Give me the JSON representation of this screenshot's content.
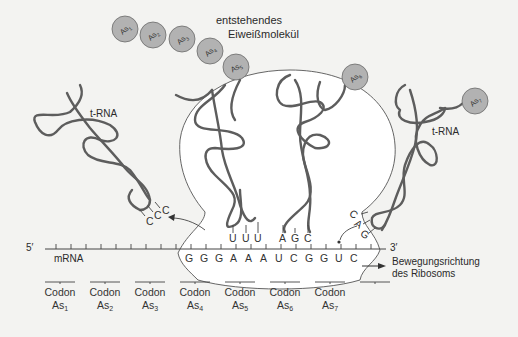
{
  "title_label": {
    "line1": "entstehendes",
    "line2": "Eiweißmolekül"
  },
  "amino_acids": [
    "As1",
    "As2",
    "As3",
    "As4",
    "As5",
    "As6",
    "As7"
  ],
  "amino_acid_display": [
    {
      "base": "As",
      "sub": "1"
    },
    {
      "base": "As",
      "sub": "2"
    },
    {
      "base": "As",
      "sub": "3"
    },
    {
      "base": "As",
      "sub": "4"
    },
    {
      "base": "As",
      "sub": "5"
    },
    {
      "base": "As",
      "sub": "6"
    },
    {
      "base": "As",
      "sub": "7"
    }
  ],
  "trna_labels": {
    "left": "t-RNA",
    "right": "t-RNA"
  },
  "anticodons": {
    "left_leaving": [
      "C",
      "C",
      "C"
    ],
    "site_1": [
      "U",
      "U",
      "U"
    ],
    "site_2": [
      "A",
      "G",
      "C"
    ],
    "right_incoming": [
      "C",
      "A",
      "G"
    ]
  },
  "mrna": {
    "label": "mRNA",
    "five_prime": "5′",
    "three_prime": "3′",
    "bases": [
      "G",
      "G",
      "G",
      "A",
      "A",
      "A",
      "U",
      "C",
      "G",
      "G",
      "U",
      "C"
    ]
  },
  "codons": [
    {
      "label": "Codon",
      "aa": "As",
      "sub": "1"
    },
    {
      "label": "Codon",
      "aa": "As",
      "sub": "2"
    },
    {
      "label": "Codon",
      "aa": "As",
      "sub": "3"
    },
    {
      "label": "Codon",
      "aa": "As",
      "sub": "4"
    },
    {
      "label": "Codon",
      "aa": "As",
      "sub": "5"
    },
    {
      "label": "Codon",
      "aa": "As",
      "sub": "6"
    },
    {
      "label": "Codon",
      "aa": "As",
      "sub": "7"
    }
  ],
  "direction_label": {
    "line1": "Bewegungsrichtung",
    "line2": "des Ribosoms"
  },
  "colors": {
    "background": "#f3f3f1",
    "ribosome_fill": "#ffffff",
    "rna_strand": "#5d5d5d",
    "amino_acid_fill": "#b2b2b2"
  }
}
